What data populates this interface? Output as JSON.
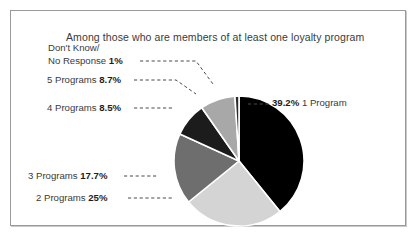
{
  "frame": {
    "border_color": "#9a9a9a"
  },
  "title": "Among those who are members of at least one loyalty program",
  "chart_data": {
    "type": "pie",
    "title": "Among those who are members of at least one loyalty program",
    "xlabel": "",
    "ylabel": "",
    "legend_position": "outside-callouts",
    "grid": false,
    "start_angle_deg": 0,
    "direction": "clockwise",
    "categories": [
      "1 Program",
      "2 Programs",
      "3 Programs",
      "4 Programs",
      "5 Programs",
      "Don't Know/No Response"
    ],
    "values": [
      39.2,
      25,
      17.7,
      8.5,
      8.7,
      1
    ],
    "value_labels": [
      "39.2%",
      "25%",
      "17.7%",
      "8.5%",
      "8.7%",
      "1%"
    ],
    "colors": [
      "#000000",
      "#d4d4d4",
      "#6e6e6e",
      "#1c1c1c",
      "#a8a8a8",
      "#2b2b2b"
    ],
    "slices": [
      {
        "name": "1 Program",
        "value": 39.2,
        "value_label": "39.2%",
        "color": "#000000",
        "label_text": "1 Program",
        "label_order": "value-first"
      },
      {
        "name": "2 Programs",
        "value": 25,
        "value_label": "25%",
        "color": "#d4d4d4",
        "label_text": "2 Programs",
        "label_order": "name-first"
      },
      {
        "name": "3 Programs",
        "value": 17.7,
        "value_label": "17.7%",
        "color": "#6e6e6e",
        "label_text": "3 Programs",
        "label_order": "name-first"
      },
      {
        "name": "4 Programs",
        "value": 8.5,
        "value_label": "8.5%",
        "color": "#1c1c1c",
        "label_text": "4 Programs",
        "label_order": "name-first"
      },
      {
        "name": "5 Programs",
        "value": 8.7,
        "value_label": "8.7%",
        "color": "#a8a8a8",
        "label_text": "5 Programs",
        "label_order": "name-first"
      },
      {
        "name": "Don't Know/No Response",
        "value": 1,
        "value_label": "1%",
        "color": "#2b2b2b",
        "label_line1": "Don't Know/",
        "label_line2": "No Response",
        "label_order": "name-first"
      }
    ]
  },
  "labels": {
    "dk_line1": "Don't Know/",
    "dk_line2": "No Response",
    "dk_value": "1%",
    "p5_name": "5 Programs",
    "p5_value": "8.7%",
    "p4_name": "4 Programs",
    "p4_value": "8.5%",
    "p3_name": "3 Programs",
    "p3_value": "17.7%",
    "p2_name": "2 Programs",
    "p2_value": "25%",
    "p1_name": "1 Program",
    "p1_value": "39.2%"
  }
}
